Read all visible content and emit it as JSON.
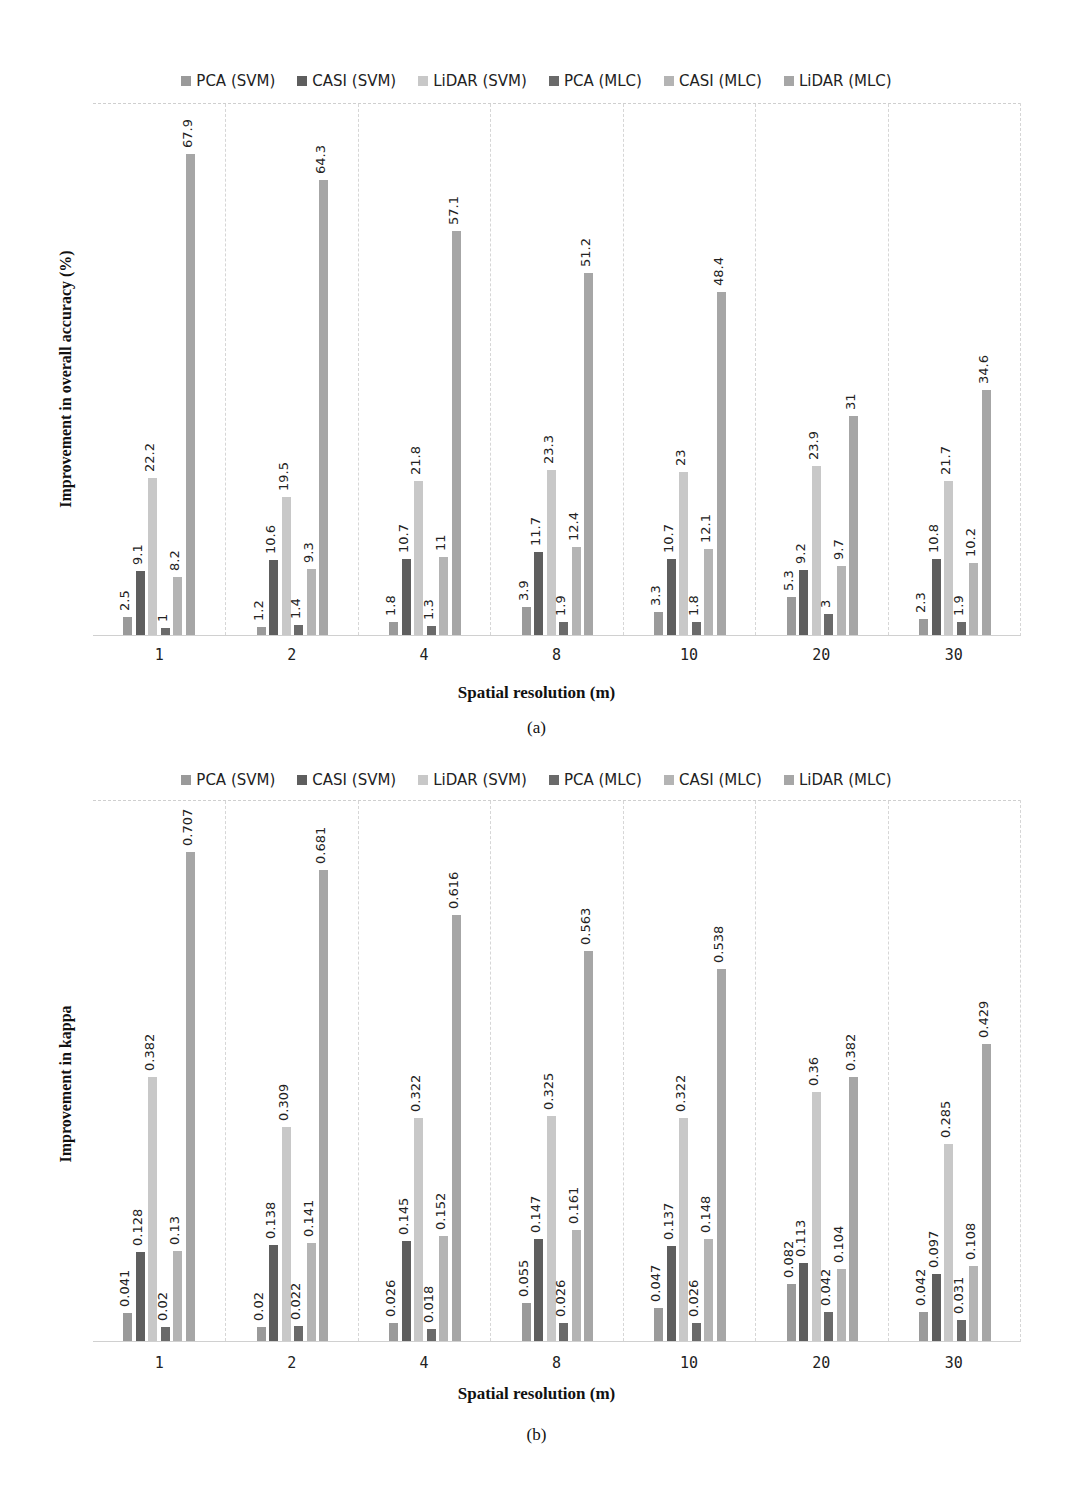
{
  "series_colors": [
    "#9a9a9a",
    "#5e5e5e",
    "#c8c8c8",
    "#6a6a6a",
    "#b4b4b4",
    "#a6a6a6"
  ],
  "chart_data": [
    {
      "type": "bar",
      "panel": "(a)",
      "title": "",
      "xlabel": "Spatial resolution (m)",
      "ylabel": "Improvement in overall accuracy (%)",
      "categories": [
        "1",
        "2",
        "4",
        "8",
        "10",
        "20",
        "30"
      ],
      "ylim": [
        0,
        75
      ],
      "grid": "vertical dashed separators between categories",
      "legend_position": "top",
      "series": [
        {
          "name": "PCA (SVM)",
          "values": [
            2.5,
            1.2,
            1.8,
            3.9,
            3.3,
            5.3,
            2.3
          ],
          "labels": [
            "2.5",
            "1.2",
            "1.8",
            "3.9",
            "3.3",
            "5.3",
            "2.3"
          ]
        },
        {
          "name": "CASI (SVM)",
          "values": [
            9.1,
            10.6,
            10.7,
            11.7,
            10.7,
            9.2,
            10.8
          ],
          "labels": [
            "9.1",
            "10.6",
            "10.7",
            "11.7",
            "10.7",
            "9.2",
            "10.8"
          ]
        },
        {
          "name": "LiDAR (SVM)",
          "values": [
            22.2,
            19.5,
            21.8,
            23.3,
            23,
            23.9,
            21.7
          ],
          "labels": [
            "22.2",
            "19.5",
            "21.8",
            "23.3",
            "23",
            "23.9",
            "21.7"
          ]
        },
        {
          "name": "PCA (MLC)",
          "values": [
            1,
            1.4,
            1.3,
            1.9,
            1.8,
            3,
            1.9
          ],
          "labels": [
            "1",
            "1.4",
            "1.3",
            "1.9",
            "1.8",
            "3",
            "1.9"
          ]
        },
        {
          "name": "CASI (MLC)",
          "values": [
            8.2,
            9.3,
            11,
            12.4,
            12.1,
            9.7,
            10.2
          ],
          "labels": [
            "8.2",
            "9.3",
            "11",
            "12.4",
            "12.1",
            "9.7",
            "10.2"
          ]
        },
        {
          "name": "LiDAR (MLC)",
          "values": [
            67.9,
            64.3,
            57.1,
            51.2,
            48.4,
            31,
            34.6
          ],
          "labels": [
            "67.9",
            "64.3",
            "57.1",
            "51.2",
            "48.4",
            "31",
            "34.6"
          ]
        }
      ],
      "caption": "(a)"
    },
    {
      "type": "bar",
      "panel": "(b)",
      "title": "",
      "xlabel": "Spatial resolution (m)",
      "ylabel": "Improvement in kappa",
      "categories": [
        "1",
        "2",
        "4",
        "8",
        "10",
        "20",
        "30"
      ],
      "ylim": [
        0,
        0.78
      ],
      "grid": "vertical dashed separators between categories",
      "legend_position": "top",
      "series": [
        {
          "name": "PCA (SVM)",
          "values": [
            0.041,
            0.02,
            0.026,
            0.055,
            0.047,
            0.082,
            0.042
          ],
          "labels": [
            "0.041",
            "0.02",
            "0.026",
            "0.055",
            "0.047",
            "0.082",
            "0.042"
          ]
        },
        {
          "name": "CASI (SVM)",
          "values": [
            0.128,
            0.138,
            0.145,
            0.147,
            0.137,
            0.113,
            0.097
          ],
          "labels": [
            "0.128",
            "0.138",
            "0.145",
            "0.147",
            "0.137",
            "0.113",
            "0.097"
          ]
        },
        {
          "name": "LiDAR (SVM)",
          "values": [
            0.382,
            0.309,
            0.322,
            0.325,
            0.322,
            0.36,
            0.285
          ],
          "labels": [
            "0.382",
            "0.309",
            "0.322",
            "0.325",
            "0.322",
            "0.36",
            "0.285"
          ]
        },
        {
          "name": "PCA (MLC)",
          "values": [
            0.02,
            0.022,
            0.018,
            0.026,
            0.026,
            0.042,
            0.031
          ],
          "labels": [
            "0.02",
            "0.022",
            "0.018",
            "0.026",
            "0.026",
            "0.042",
            "0.031"
          ]
        },
        {
          "name": "CASI (MLC)",
          "values": [
            0.13,
            0.141,
            0.152,
            0.161,
            0.148,
            0.104,
            0.108
          ],
          "labels": [
            "0.13",
            "0.141",
            "0.152",
            "0.161",
            "0.148",
            "0.104",
            "0.108"
          ]
        },
        {
          "name": "LiDAR (MLC)",
          "values": [
            0.707,
            0.681,
            0.616,
            0.563,
            0.538,
            0.382,
            0.429
          ],
          "labels": [
            "0.707",
            "0.681",
            "0.616",
            "0.563",
            "0.538",
            "0.382",
            "0.429"
          ]
        }
      ],
      "caption": "(b)"
    }
  ]
}
